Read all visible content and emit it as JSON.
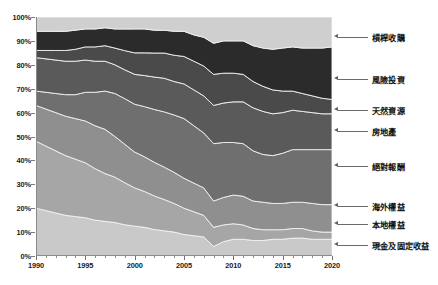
{
  "chart_data": {
    "type": "area",
    "title": "",
    "subtitle": "",
    "xlabel": "",
    "ylabel": "",
    "stacked": true,
    "normalized_percent": true,
    "grid": false,
    "legend_position": "right-leader-lines",
    "xlim": [
      1990,
      2020
    ],
    "ylim": [
      0,
      100
    ],
    "x_tick_labels": [
      "1990",
      "1995",
      "2000",
      "2005",
      "2010",
      "2015",
      "2020"
    ],
    "x_major_ticks": [
      1990,
      1995,
      2000,
      2005,
      2010,
      2015,
      2020
    ],
    "y_tick_labels": [
      "0%",
      "10%",
      "20%",
      "30%",
      "40%",
      "50%",
      "60%",
      "70%",
      "80%",
      "90%",
      "100%"
    ],
    "y_ticks": [
      0,
      10,
      20,
      30,
      40,
      50,
      60,
      70,
      80,
      90,
      100
    ],
    "x": [
      1990,
      1991,
      1992,
      1993,
      1994,
      1995,
      1996,
      1997,
      1998,
      1999,
      2000,
      2001,
      2002,
      2003,
      2004,
      2005,
      2006,
      2007,
      2008,
      2009,
      2010,
      2011,
      2012,
      2013,
      2014,
      2015,
      2016,
      2017,
      2018,
      2019,
      2020
    ],
    "series": [
      {
        "name": "現金及固定收益",
        "color": "#c9c9c9",
        "values": [
          20.0,
          19.0,
          18.0,
          17.0,
          16.5,
          16.0,
          15.0,
          14.5,
          14.0,
          13.0,
          12.5,
          12.0,
          11.0,
          10.5,
          10.0,
          9.0,
          8.5,
          8.0,
          4.0,
          6.0,
          7.0,
          7.0,
          6.5,
          6.5,
          7.0,
          7.0,
          7.5,
          7.5,
          7.0,
          7.0,
          7.0
        ]
      },
      {
        "name": "本地權益",
        "color": "#a6a6a6",
        "values": [
          28.0,
          27.0,
          26.0,
          25.0,
          24.0,
          23.0,
          21.5,
          20.0,
          19.0,
          17.5,
          16.0,
          15.0,
          14.0,
          13.0,
          12.0,
          11.0,
          10.0,
          9.0,
          8.0,
          7.0,
          6.5,
          6.0,
          5.0,
          4.5,
          4.0,
          4.0,
          4.0,
          4.0,
          3.5,
          3.0,
          3.0
        ]
      },
      {
        "name": "海外權益",
        "color": "#8f8f8f",
        "values": [
          15.0,
          15.5,
          16.0,
          16.5,
          17.0,
          17.5,
          18.0,
          18.5,
          17.0,
          16.0,
          15.0,
          14.5,
          14.0,
          13.5,
          13.0,
          12.5,
          12.0,
          11.5,
          11.0,
          11.5,
          12.0,
          12.0,
          11.5,
          11.5,
          11.0,
          11.0,
          11.0,
          11.0,
          11.5,
          11.5,
          11.5
        ]
      },
      {
        "name": "絕對報酬",
        "color": "#6f6f6f",
        "values": [
          6.0,
          7.0,
          8.0,
          9.0,
          10.0,
          12.0,
          14.0,
          16.0,
          18.0,
          19.0,
          20.0,
          21.0,
          22.0,
          23.0,
          24.0,
          25.0,
          24.0,
          23.0,
          24.0,
          23.0,
          22.0,
          22.0,
          21.0,
          20.0,
          20.0,
          21.0,
          22.0,
          22.0,
          22.5,
          23.0,
          23.0
        ]
      },
      {
        "name": "房地產",
        "color": "#5a5a5a",
        "values": [
          14.0,
          14.0,
          14.0,
          14.0,
          14.0,
          13.5,
          13.0,
          12.5,
          12.0,
          12.0,
          12.5,
          13.0,
          13.5,
          14.0,
          14.0,
          14.5,
          15.0,
          15.5,
          16.0,
          16.5,
          17.0,
          17.5,
          18.0,
          18.0,
          17.5,
          17.0,
          16.5,
          16.0,
          15.5,
          15.0,
          15.0
        ]
      },
      {
        "name": "天然資源",
        "color": "#4a4a4a",
        "values": [
          3.0,
          3.5,
          4.0,
          4.5,
          5.0,
          5.5,
          6.0,
          6.5,
          7.0,
          8.0,
          9.0,
          9.5,
          10.0,
          10.5,
          11.0,
          11.5,
          12.0,
          12.5,
          13.0,
          12.5,
          12.0,
          11.5,
          11.0,
          10.5,
          10.0,
          9.0,
          8.0,
          7.5,
          7.0,
          6.5,
          6.0
        ]
      },
      {
        "name": "風險投資",
        "color": "#2b2b2b",
        "values": [
          8.0,
          8.0,
          8.0,
          8.0,
          8.0,
          7.5,
          7.5,
          7.5,
          8.0,
          9.0,
          10.0,
          10.0,
          9.5,
          9.5,
          10.0,
          10.5,
          11.0,
          12.0,
          13.0,
          13.5,
          13.5,
          14.0,
          15.0,
          16.0,
          17.0,
          18.0,
          18.5,
          19.0,
          20.0,
          21.0,
          22.0
        ]
      },
      {
        "name": "槓桿收購",
        "color": "#cfcfcf",
        "values": [
          6.0,
          6.0,
          6.0,
          6.0,
          5.5,
          5.0,
          5.0,
          4.5,
          5.0,
          5.0,
          5.0,
          5.0,
          5.5,
          5.5,
          6.0,
          6.0,
          7.5,
          8.5,
          11.0,
          10.0,
          10.0,
          10.0,
          12.0,
          13.0,
          13.5,
          13.0,
          12.5,
          13.0,
          13.0,
          13.0,
          12.5
        ]
      }
    ]
  },
  "legend": {
    "items": [
      {
        "label": "槓桿收購",
        "y": 37
      },
      {
        "label": "風險投資",
        "y": 79
      },
      {
        "label": "天然資源",
        "y": 110
      },
      {
        "label": "房地產",
        "y": 131
      },
      {
        "label": "絕對報酬",
        "y": 166
      },
      {
        "label": "海外權益",
        "y": 206
      },
      {
        "label": "本地權益",
        "y": 224
      },
      {
        "label": "現金及固定收益",
        "y": 245
      }
    ]
  }
}
